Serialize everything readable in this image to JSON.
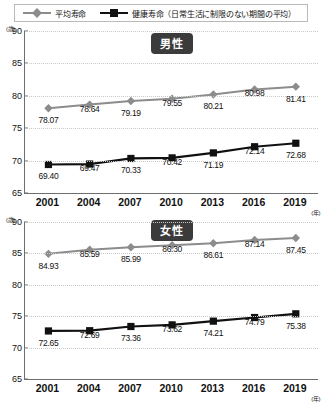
{
  "legend": {
    "items": [
      {
        "label": "平均寿命",
        "marker": "diamond-gray",
        "color": "#8c8c8c"
      },
      {
        "label": "健康寿命（日常生活に制限のない期間の平均）",
        "marker": "square-black",
        "color": "#111111"
      }
    ]
  },
  "charts": [
    {
      "badge": "男性",
      "y_unit": "(歳)",
      "x_unit": "(年)"
    },
    {
      "badge": "女性",
      "y_unit": "(歳)",
      "x_unit": "(年)"
    }
  ],
  "chart_data": [
    {
      "type": "line",
      "title": "男性",
      "xlabel": "(年)",
      "ylabel": "(歳)",
      "x": [
        "2001",
        "2004",
        "2007",
        "2010",
        "2013",
        "2016",
        "2019"
      ],
      "categories": [
        "2001",
        "2004",
        "2007",
        "2010",
        "2013",
        "2016",
        "2019"
      ],
      "yticks": [
        65,
        70,
        75,
        80,
        85,
        90
      ],
      "ylim": [
        65,
        90
      ],
      "grid": true,
      "legend_position": "top",
      "series": [
        {
          "name": "平均寿命",
          "color": "#8c8c8c",
          "marker": "diamond",
          "values": [
            78.07,
            78.64,
            79.19,
            79.55,
            80.21,
            80.98,
            81.41
          ],
          "labels": [
            "78.07",
            "78.64",
            "79.19",
            "79.55",
            "80.21",
            "80.98",
            "81.41"
          ]
        },
        {
          "name": "健康寿命（日常生活に制限のない期間の平均）",
          "color": "#111111",
          "marker": "square",
          "values": [
            69.4,
            69.47,
            70.33,
            70.42,
            71.19,
            72.14,
            72.68
          ],
          "labels": [
            "69.40",
            "69.47",
            "70.33",
            "70.42",
            "71.19",
            "72.14",
            "72.68"
          ]
        }
      ]
    },
    {
      "type": "line",
      "title": "女性",
      "xlabel": "(年)",
      "ylabel": "(歳)",
      "x": [
        "2001",
        "2004",
        "2007",
        "2010",
        "2013",
        "2016",
        "2019"
      ],
      "categories": [
        "2001",
        "2004",
        "2007",
        "2010",
        "2013",
        "2016",
        "2019"
      ],
      "yticks": [
        65,
        70,
        75,
        80,
        85,
        90
      ],
      "ylim": [
        65,
        90
      ],
      "grid": true,
      "legend_position": "top",
      "series": [
        {
          "name": "平均寿命",
          "color": "#8c8c8c",
          "marker": "diamond",
          "values": [
            84.93,
            85.59,
            85.99,
            86.3,
            86.61,
            87.14,
            87.45
          ],
          "labels": [
            "84.93",
            "85.59",
            "85.99",
            "86.30",
            "86.61",
            "87.14",
            "87.45"
          ]
        },
        {
          "name": "健康寿命（日常生活に制限のない期間の平均）",
          "color": "#111111",
          "marker": "square",
          "values": [
            72.65,
            72.69,
            73.36,
            73.62,
            74.21,
            74.79,
            75.38
          ],
          "labels": [
            "72.65",
            "72.69",
            "73.36",
            "73.62",
            "74.21",
            "74.79",
            "75.38"
          ]
        }
      ]
    }
  ]
}
